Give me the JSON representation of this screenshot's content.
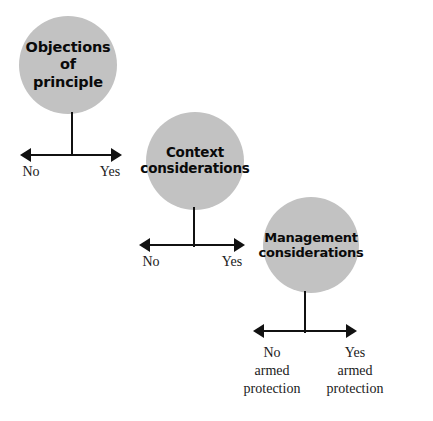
{
  "diagram": {
    "background_color": "#ffffff",
    "bubble_fill_color": "#c2c2c2",
    "line_color": "#111111",
    "nodes": [
      {
        "id": "objections-of-principle",
        "label": "Objections\nof\nprinciple",
        "axis": {
          "left_label": "No",
          "right_label": "Yes"
        }
      },
      {
        "id": "context-considerations",
        "label": "Context\nconsiderations",
        "axis": {
          "left_label": "No",
          "right_label": "Yes"
        }
      },
      {
        "id": "management-considerations",
        "label": "Management\nconsiderations",
        "axis": {
          "left_label": "No\narmed\nprotection",
          "right_label": "Yes\narmed\nprotection"
        }
      }
    ]
  }
}
